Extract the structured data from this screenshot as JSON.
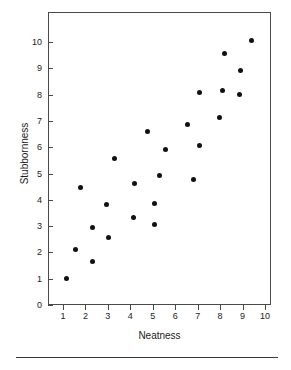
{
  "chart_data": {
    "type": "scatter",
    "title": "",
    "xlabel": "Neatness",
    "ylabel": "Stubbornness",
    "xlim": [
      0.5,
      10.2
    ],
    "ylim": [
      0,
      10.6
    ],
    "xticks": [
      1,
      2,
      3,
      4,
      5,
      6,
      7,
      8,
      9,
      10
    ],
    "yticks": [
      0,
      1,
      2,
      3,
      4,
      5,
      6,
      7,
      8,
      9,
      10
    ],
    "xtick_labels": [
      "1",
      "2",
      "3",
      "4",
      "5",
      "6",
      "7",
      "8",
      "9",
      "10"
    ],
    "ytick_labels": [
      "0",
      "1",
      "2",
      "3",
      "4",
      "5",
      "6",
      "7",
      "8",
      "9",
      "10"
    ],
    "grid": false,
    "legend": null,
    "marker": "filled-circle",
    "marker_color": "#111111",
    "frame_color": "#4a4a4a",
    "points": [
      {
        "x": 1.1,
        "y": 1.05
      },
      {
        "x": 1.5,
        "y": 2.15
      },
      {
        "x": 1.75,
        "y": 4.5
      },
      {
        "x": 2.25,
        "y": 1.7
      },
      {
        "x": 2.25,
        "y": 3.0
      },
      {
        "x": 2.9,
        "y": 3.85
      },
      {
        "x": 3.0,
        "y": 2.6
      },
      {
        "x": 3.25,
        "y": 5.6
      },
      {
        "x": 4.1,
        "y": 3.35
      },
      {
        "x": 4.15,
        "y": 4.65
      },
      {
        "x": 4.7,
        "y": 6.65
      },
      {
        "x": 5.05,
        "y": 3.1
      },
      {
        "x": 5.05,
        "y": 3.9
      },
      {
        "x": 5.25,
        "y": 4.95
      },
      {
        "x": 5.5,
        "y": 5.95
      },
      {
        "x": 6.5,
        "y": 6.9
      },
      {
        "x": 6.75,
        "y": 4.8
      },
      {
        "x": 7.05,
        "y": 6.1
      },
      {
        "x": 7.05,
        "y": 8.1
      },
      {
        "x": 7.95,
        "y": 7.15
      },
      {
        "x": 8.05,
        "y": 8.2
      },
      {
        "x": 8.15,
        "y": 9.6
      },
      {
        "x": 8.8,
        "y": 8.05
      },
      {
        "x": 8.85,
        "y": 8.95
      },
      {
        "x": 9.35,
        "y": 10.1
      }
    ]
  },
  "axes": {
    "x_title": "Neatness",
    "y_title": "Stubbornness"
  }
}
